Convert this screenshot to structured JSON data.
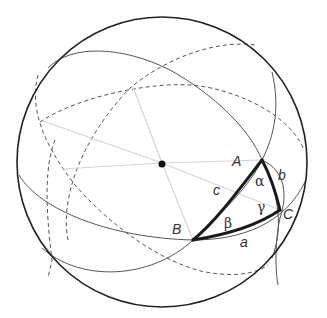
{
  "diagram": {
    "type": "spherical-triangle",
    "vertices": {
      "A": "A",
      "B": "B",
      "C": "C"
    },
    "sides": {
      "a": "a",
      "b": "b",
      "c": "c"
    },
    "angles": {
      "alpha": "α",
      "beta": "β",
      "gamma": "γ"
    },
    "center_label": "",
    "colors": {
      "triangle": "#1a1a1a",
      "great_circles": "#555555",
      "radii": "#d4d4d4",
      "rim": "#222222"
    }
  }
}
